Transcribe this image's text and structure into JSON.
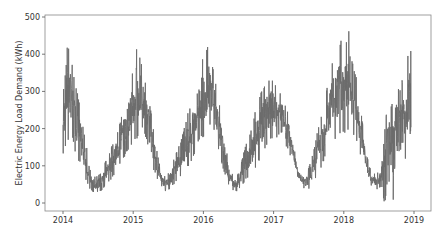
{
  "chart_data": {
    "type": "line",
    "title": "",
    "xlabel": "",
    "ylabel": "Electric Energy Load Demand (kWh)",
    "xlim": [
      2013.87,
      2019.25
    ],
    "ylim": [
      -20,
      500
    ],
    "x_ticks": [
      "2014",
      "2015",
      "2016",
      "2017",
      "2018",
      "2019"
    ],
    "y_ticks": [
      "0",
      "100",
      "200",
      "300",
      "400",
      "500"
    ],
    "grid": false,
    "legend": null,
    "line_color": "#6b6b6b",
    "series": [
      {
        "name": "Electric Energy Load Demand",
        "x": [
          2014.0,
          2014.04,
          2014.08,
          2014.12,
          2014.17,
          2014.21,
          2014.25,
          2014.29,
          2014.33,
          2014.37,
          2014.42,
          2014.46,
          2014.5,
          2014.54,
          2014.58,
          2014.62,
          2014.67,
          2014.71,
          2014.75,
          2014.79,
          2014.83,
          2014.87,
          2014.92,
          2014.96,
          2015.0,
          2015.04,
          2015.08,
          2015.12,
          2015.17,
          2015.21,
          2015.25,
          2015.29,
          2015.33,
          2015.37,
          2015.42,
          2015.46,
          2015.5,
          2015.54,
          2015.58,
          2015.62,
          2015.67,
          2015.71,
          2015.75,
          2015.79,
          2015.83,
          2015.87,
          2015.92,
          2015.96,
          2016.0,
          2016.04,
          2016.08,
          2016.12,
          2016.17,
          2016.21,
          2016.25,
          2016.29,
          2016.33,
          2016.37,
          2016.42,
          2016.46,
          2016.5,
          2016.54,
          2016.58,
          2016.62,
          2016.67,
          2016.71,
          2016.75,
          2016.79,
          2016.83,
          2016.87,
          2016.92,
          2016.96,
          2017.0,
          2017.04,
          2017.08,
          2017.12,
          2017.17,
          2017.21,
          2017.25,
          2017.29,
          2017.33,
          2017.37,
          2017.42,
          2017.46,
          2017.5,
          2017.54,
          2017.58,
          2017.62,
          2017.67,
          2017.71,
          2017.75,
          2017.79,
          2017.83,
          2017.87,
          2017.92,
          2017.96,
          2018.0,
          2018.04,
          2018.08,
          2018.12,
          2018.17,
          2018.21,
          2018.25,
          2018.29,
          2018.33,
          2018.37,
          2018.42,
          2018.46,
          2018.5,
          2018.54,
          2018.58,
          2018.62,
          2018.67,
          2018.71,
          2018.75,
          2018.79,
          2018.83,
          2018.87,
          2018.92,
          2018.96,
          2019.0
        ],
        "min": [
          130,
          150,
          170,
          180,
          140,
          120,
          100,
          80,
          60,
          40,
          30,
          28,
          30,
          32,
          40,
          50,
          60,
          70,
          80,
          95,
          110,
          120,
          140,
          150,
          150,
          170,
          180,
          200,
          180,
          150,
          110,
          90,
          70,
          55,
          40,
          32,
          35,
          40,
          50,
          60,
          70,
          80,
          90,
          100,
          110,
          130,
          160,
          170,
          170,
          180,
          200,
          210,
          180,
          150,
          110,
          85,
          60,
          45,
          35,
          30,
          35,
          45,
          55,
          65,
          75,
          85,
          95,
          110,
          120,
          140,
          160,
          170,
          160,
          170,
          180,
          190,
          150,
          140,
          120,
          100,
          75,
          55,
          40,
          35,
          38,
          45,
          60,
          75,
          90,
          110,
          130,
          140,
          150,
          160,
          170,
          190,
          180,
          190,
          200,
          180,
          170,
          150,
          120,
          100,
          70,
          50,
          40,
          35,
          40,
          45,
          -10,
          50,
          60,
          -10,
          70,
          80,
          90,
          110,
          150,
          200
        ],
        "max": [
          280,
          440,
          420,
          390,
          320,
          300,
          250,
          200,
          160,
          120,
          80,
          70,
          75,
          80,
          100,
          120,
          140,
          160,
          180,
          200,
          230,
          260,
          300,
          330,
          360,
          430,
          400,
          380,
          330,
          300,
          250,
          200,
          150,
          110,
          80,
          70,
          80,
          100,
          120,
          140,
          160,
          190,
          220,
          250,
          260,
          300,
          350,
          380,
          400,
          420,
          420,
          380,
          330,
          290,
          240,
          190,
          140,
          100,
          75,
          70,
          80,
          110,
          140,
          170,
          190,
          220,
          260,
          290,
          300,
          320,
          330,
          345,
          330,
          320,
          300,
          290,
          260,
          240,
          200,
          150,
          110,
          80,
          70,
          75,
          95,
          120,
          150,
          190,
          230,
          260,
          300,
          350,
          380,
          400,
          420,
          440,
          430,
          440,
          475,
          380,
          350,
          300,
          240,
          180,
          130,
          95,
          80,
          78,
          85,
          100,
          190,
          270,
          260,
          300,
          330,
          300,
          330,
          360,
          410,
          420,
          415
        ]
      }
    ]
  }
}
